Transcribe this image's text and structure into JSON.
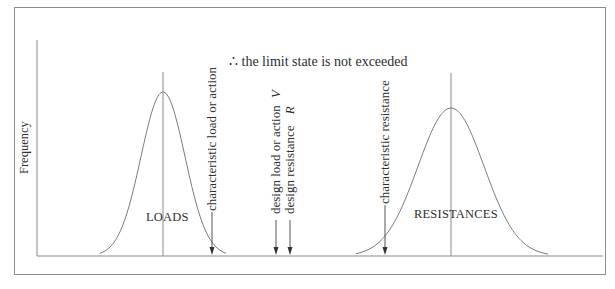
{
  "figure": {
    "title": "∴ the limit state is not exceeded",
    "y_axis_label": "Frequency",
    "distributions": [
      {
        "name": "loads",
        "label": "LOADS",
        "peak_x": 163,
        "peak_y": 92,
        "spread": 22
      },
      {
        "name": "resistances",
        "label": "RESISTANCES",
        "peak_x": 451,
        "peak_y": 108,
        "spread": 33
      }
    ],
    "markers": [
      {
        "name": "characteristic-load",
        "label": "characteristic load or action",
        "x": 212
      },
      {
        "name": "design-load",
        "label": "design load or action",
        "symbol": "V",
        "x": 276
      },
      {
        "name": "design-resistance",
        "label": "design resistance",
        "symbol": "R",
        "x": 290
      },
      {
        "name": "characteristic-resistance",
        "label": "characteristic resistance",
        "x": 385
      }
    ],
    "colors": {
      "line": "#6e6e6e",
      "frame": "#8c8c8c",
      "text": "#2e2e2e"
    }
  }
}
